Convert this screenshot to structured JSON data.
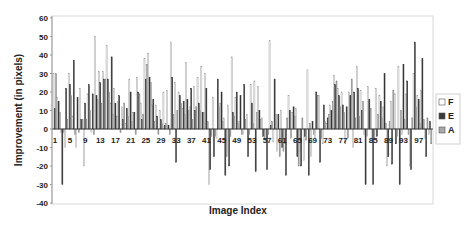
{
  "chart_data": {
    "type": "bar",
    "title": "",
    "xlabel": "Image Index",
    "ylabel": "Improvement (in pixels)",
    "ylim": [
      -40,
      60
    ],
    "yticks": [
      60,
      50,
      40,
      30,
      20,
      10,
      0,
      -10,
      -20,
      -30,
      -40
    ],
    "grid": false,
    "legend_position": "right",
    "x": [
      1,
      2,
      3,
      4,
      5,
      6,
      7,
      8,
      9,
      10,
      11,
      12,
      13,
      14,
      15,
      16,
      17,
      18,
      19,
      20,
      21,
      22,
      23,
      24,
      25,
      26,
      27,
      28,
      29,
      30,
      31,
      32,
      33,
      34,
      35,
      36,
      37,
      38,
      39,
      40,
      41,
      42,
      43,
      44,
      45,
      46,
      47,
      48,
      49,
      50,
      51,
      52,
      53,
      54,
      55,
      56,
      57,
      58,
      59,
      60,
      61,
      62,
      63,
      64,
      65,
      66,
      67,
      68,
      69,
      70,
      71,
      72,
      73,
      74,
      75,
      76,
      77,
      78,
      79,
      80,
      81,
      82,
      83,
      84,
      85,
      86,
      87,
      88,
      89,
      90,
      91,
      92,
      93,
      94,
      95,
      96,
      97,
      98,
      99,
      100
    ],
    "xtick_labels": [
      "1",
      "5",
      "9",
      "13",
      "17",
      "21",
      "25",
      "29",
      "33",
      "37",
      "41",
      "45",
      "49",
      "53",
      "57",
      "61",
      "65",
      "69",
      "73",
      "77",
      "81",
      "85",
      "89",
      "93",
      "97"
    ],
    "series": [
      {
        "name": "F",
        "color": "#ffffff",
        "values": [
          30,
          17,
          -2,
          -10,
          30,
          7,
          -10,
          22,
          -20,
          19,
          -2,
          50,
          31,
          31,
          45,
          14,
          22,
          15,
          12,
          3,
          27,
          9,
          28,
          14,
          38,
          41,
          13,
          13,
          10,
          20,
          21,
          47,
          25,
          20,
          11,
          36,
          12,
          23,
          28,
          34,
          30,
          -30,
          17,
          -5,
          14,
          6,
          13,
          39,
          17,
          4,
          -3,
          8,
          24,
          26,
          23,
          6,
          -6,
          48,
          -7,
          -12,
          10,
          -8,
          18,
          9,
          11,
          -12,
          -17,
          32,
          -15,
          -5,
          18,
          -8,
          3,
          13,
          29,
          22,
          20,
          -8,
          20,
          -10,
          34,
          21,
          -3,
          23,
          -5,
          22,
          18,
          12,
          -20,
          15,
          19,
          34,
          -3,
          19,
          -20,
          30,
          18,
          21,
          -5,
          -3
        ],
        "note": "values estimated from bar heights"
      },
      {
        "name": "E",
        "color": "#3a3a3a",
        "values": [
          11,
          15,
          -30,
          22,
          24,
          37,
          17,
          5,
          14,
          24,
          19,
          18,
          25,
          27,
          27,
          39,
          14,
          18,
          5,
          11,
          20,
          9,
          20,
          5,
          27,
          28,
          16,
          7,
          5,
          2,
          2,
          28,
          -18,
          18,
          15,
          16,
          22,
          10,
          14,
          9,
          22,
          -22,
          -15,
          27,
          20,
          -25,
          -20,
          9,
          20,
          18,
          24,
          -15,
          14,
          -23,
          10,
          -4,
          -22,
          2,
          27,
          8,
          -10,
          -25,
          10,
          12,
          -15,
          -20,
          -4,
          -25,
          4,
          20,
          -18,
          13,
          6,
          10,
          24,
          18,
          13,
          12,
          18,
          20,
          22,
          10,
          -30,
          16,
          -30,
          -4,
          15,
          30,
          -15,
          -19,
          -8,
          -30,
          35,
          26,
          -22,
          47,
          16,
          38,
          -15,
          4
        ],
        "note": "values estimated from bar heights"
      },
      {
        "name": "A",
        "color": "#a8a8a8",
        "values": [
          30,
          9,
          -2,
          5,
          18,
          -3,
          -2,
          5,
          5,
          10,
          -3,
          16,
          14,
          27,
          20,
          8,
          7,
          -2,
          14,
          7,
          4,
          -3,
          19,
          8,
          35,
          25,
          4,
          -3,
          3,
          3,
          -3,
          8,
          10,
          14,
          8,
          10,
          5,
          12,
          10,
          9,
          4,
          -4,
          -4,
          12,
          4,
          -15,
          -4,
          7,
          3,
          -3,
          5,
          -3,
          3,
          9,
          5,
          -5,
          -3,
          4,
          8,
          -15,
          -12,
          6,
          -5,
          7,
          -20,
          6,
          -6,
          3,
          -3,
          18,
          -5,
          4,
          8,
          15,
          26,
          12,
          9,
          -5,
          27,
          6,
          7,
          15,
          -4,
          11,
          -5,
          8,
          6,
          3,
          4,
          21,
          -4,
          10,
          5,
          -3,
          6,
          12,
          3,
          5,
          6,
          -8
        ],
        "note": "values estimated from bar heights"
      }
    ]
  }
}
